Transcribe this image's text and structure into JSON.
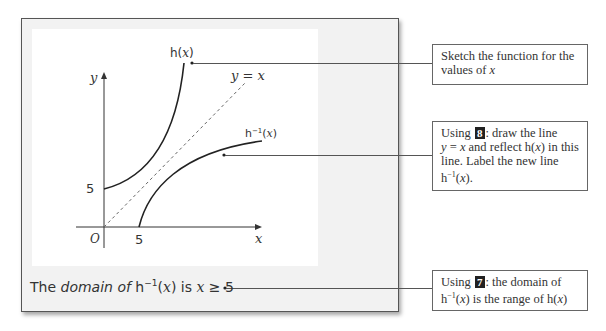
{
  "graph": {
    "axis_labels": {
      "x": "x",
      "y": "y",
      "origin": "O"
    },
    "ticks": {
      "x_intercept": "5",
      "y_intercept": "5"
    },
    "curves": [
      {
        "name": "h(x)",
        "label_fn": "h",
        "label_arg": "x",
        "description": "increasing curve starting at (0,5)"
      },
      {
        "name": "h^-1(x)",
        "label_fn": "h",
        "label_sup": "−1",
        "label_arg": "x",
        "description": "reflection of h(x) in y = x, starting at (5,0)"
      }
    ],
    "line_label": {
      "lhs": "y",
      "eq": " = ",
      "rhs": "x",
      "style": "dashed"
    }
  },
  "domain_statement": {
    "prefix": "The ",
    "word_domain": "domain",
    "of": " of ",
    "fn": "h",
    "sup": "−1",
    "arg_open": "(",
    "arg": "x",
    "arg_close": ")",
    "is": " is ",
    "var": "x",
    "relation": " ≥ ",
    "value": "5"
  },
  "notes": [
    {
      "text_1": "Sketch the function for the values of ",
      "var": "x"
    },
    {
      "using": "Using ",
      "badge": "8",
      "line1_rest": ": draw the line",
      "eq_y": "y",
      "eq_mid": " = ",
      "eq_x": "x",
      "reflect": " and reflect h(",
      "reflect_x": "x",
      "reflect_end": ") in this line. Label the new line h",
      "sup": "−1",
      "end_open": "(",
      "end_x": "x",
      "end_close": ")."
    },
    {
      "using": "Using ",
      "badge": "7",
      "rest1": ": the domain of h",
      "sup": "−1",
      "open": "(",
      "x1": "x",
      "rest2": ") is the range of h(",
      "x2": "x",
      "close": ")"
    }
  ],
  "colors": {
    "frame_bg": "#f2f2f2",
    "panel_bg": "#ffffff",
    "ink": "#333333",
    "badge_bg": "#222222"
  }
}
